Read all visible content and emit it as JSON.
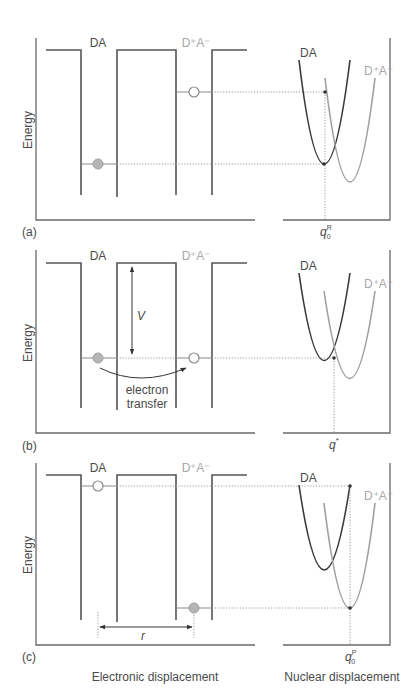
{
  "figure": {
    "colors": {
      "dark_line": "#3a3a3a",
      "light_line": "#a0a0a0",
      "filled_electron": "#b0b0b0",
      "axis": "#6a6a6a"
    },
    "panels": [
      {
        "id": "a",
        "panel_label": "(a)",
        "y_axis_label": "Energy",
        "well_labels": {
          "left": "DA",
          "right": "D⁺A⁻"
        },
        "curve_labels": {
          "left": "DA",
          "right": "D⁺A⁻"
        },
        "x_marker": {
          "base": "q",
          "sub": "0",
          "sup": "R"
        },
        "electron_state": "donor-occupied (filled circle low in DA well), acceptor empty (open circle high in D⁺A⁻ well)"
      },
      {
        "id": "b",
        "panel_label": "(b)",
        "y_axis_label": "Energy",
        "well_labels": {
          "left": "DA",
          "right": "D⁺A⁻"
        },
        "curve_labels": {
          "left": "DA",
          "right": "D⁺A⁻"
        },
        "barrier_label": "V",
        "transfer_label_line1": "electron",
        "transfer_label_line2": "transfer",
        "x_marker": {
          "base": "q",
          "sub": "",
          "sup": "*"
        }
      },
      {
        "id": "c",
        "panel_label": "(c)",
        "y_axis_label": "Energy",
        "well_labels": {
          "left": "DA",
          "right": "D⁺A⁻"
        },
        "curve_labels": {
          "left": "DA",
          "right": "D⁺A⁻"
        },
        "distance_label": "r",
        "x_marker": {
          "base": "q",
          "sub": "0",
          "sup": "P"
        }
      }
    ],
    "x_axis_labels": {
      "left": "Electronic displacement",
      "right": "Nuclear displacement"
    }
  }
}
